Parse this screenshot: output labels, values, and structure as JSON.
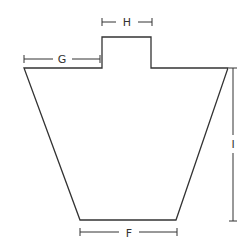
{
  "diagram": {
    "title": "",
    "shape": {
      "description": "trapezoid body with rectangular tab on top",
      "points": [
        [
          24,
          68
        ],
        [
          102,
          68
        ],
        [
          102,
          37
        ],
        [
          151,
          37
        ],
        [
          151,
          68
        ],
        [
          228,
          68
        ],
        [
          176,
          220
        ],
        [
          80,
          220
        ]
      ]
    },
    "dimensions": [
      {
        "label": "H",
        "orientation": "horizontal",
        "from": 102,
        "to": 152,
        "at": 22,
        "label_pos": [
          127,
          26
        ]
      },
      {
        "label": "G",
        "orientation": "horizontal",
        "from": 24,
        "to": 100,
        "at": 59,
        "label_pos": [
          62,
          63
        ]
      },
      {
        "label": "I",
        "orientation": "vertical",
        "from": 68,
        "to": 221,
        "at": 233,
        "label_pos": [
          233,
          144
        ]
      },
      {
        "label": "F",
        "orientation": "horizontal",
        "from": 80,
        "to": 177,
        "at": 232,
        "label_pos": [
          129,
          236
        ]
      }
    ],
    "colors": {
      "stroke": "#333333",
      "background": "#ffffff"
    }
  }
}
